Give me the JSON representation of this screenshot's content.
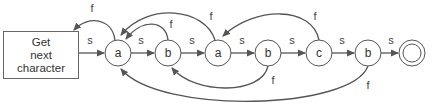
{
  "diagram": {
    "type": "finite-automaton",
    "start_box": {
      "lines": [
        "Get",
        "next",
        "character"
      ]
    },
    "states": [
      {
        "id": "a1",
        "label": "a"
      },
      {
        "id": "b1",
        "label": "b"
      },
      {
        "id": "a2",
        "label": "a"
      },
      {
        "id": "b2",
        "label": "b"
      },
      {
        "id": "c",
        "label": "c"
      },
      {
        "id": "b3",
        "label": "b"
      },
      {
        "id": "final",
        "label": ""
      }
    ],
    "success_label": "s",
    "failure_label": "f",
    "transitions": [
      {
        "from": "start",
        "to": "a1",
        "label": "s"
      },
      {
        "from": "a1",
        "to": "b1",
        "label": "s"
      },
      {
        "from": "b1",
        "to": "a2",
        "label": "s"
      },
      {
        "from": "a2",
        "to": "b2",
        "label": "s"
      },
      {
        "from": "b2",
        "to": "c",
        "label": "s"
      },
      {
        "from": "c",
        "to": "b3",
        "label": "s"
      },
      {
        "from": "b3",
        "to": "final",
        "label": "s"
      },
      {
        "from": "a1",
        "to": "start",
        "label": "f"
      },
      {
        "from": "b1",
        "to": "a1",
        "label": "f"
      },
      {
        "from": "a2",
        "to": "a1",
        "label": "f"
      },
      {
        "from": "b2",
        "to": "b1",
        "label": "f"
      },
      {
        "from": "c",
        "to": "a2",
        "label": "f"
      },
      {
        "from": "b3",
        "to": "a1",
        "label": "f"
      }
    ]
  },
  "colors": {
    "stroke": "#555555",
    "text": "#333333",
    "background": "#ffffff"
  }
}
